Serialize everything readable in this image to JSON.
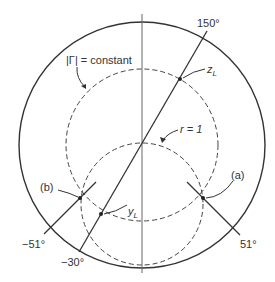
{
  "diagram": {
    "labels": {
      "gamma_circle": "|Γ| = constant",
      "r_circle": "r = 1",
      "z_load": "z",
      "z_load_sub": "L",
      "y_load": "y",
      "y_load_sub": "L",
      "point_a": "(a)",
      "point_b": "(b)",
      "angle_150": "150°",
      "angle_neg30": "−30°",
      "angle_51": "51°",
      "angle_neg51": "−51°"
    },
    "colors": {
      "stroke": "#333333",
      "axis": "#666666",
      "background": "#ffffff"
    },
    "elements": {
      "outer_circle": {
        "cx": 142,
        "cy": 145,
        "r": 123
      },
      "gamma_circle": {
        "cx": 142,
        "cy": 145,
        "r": 76,
        "style": "dashed"
      },
      "r1_circle": {
        "cx": 142,
        "cy": 204,
        "r": 61,
        "style": "dashed"
      },
      "points": [
        {
          "name": "z_L",
          "x": 180,
          "y": 79
        },
        {
          "name": "y_L",
          "x": 101,
          "y": 214
        },
        {
          "name": "a",
          "x": 203,
          "y": 198
        },
        {
          "name": "b",
          "x": 80,
          "y": 198
        }
      ]
    }
  }
}
